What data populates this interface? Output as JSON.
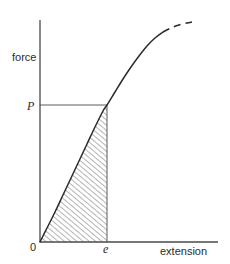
{
  "figure": {
    "background_color": "#ffffff",
    "ink_color": "#2b2b2b",
    "width": 230,
    "height": 264
  },
  "axes": {
    "y_axis_label": "force",
    "x_axis_label": "extension",
    "origin_label": "0",
    "y_axis": {
      "x": 40,
      "y_top": 20,
      "y_bottom": 242
    },
    "x_axis": {
      "y": 242,
      "x_left": 40,
      "x_right": 218
    }
  },
  "markers": {
    "force_value_label": "P",
    "extension_value_label": "e",
    "force_value_y": 105,
    "extension_value_x": 107
  },
  "guides": {
    "horizontal_from_p": {
      "x1": 40,
      "y1": 105,
      "x2": 107,
      "y2": 105
    },
    "vertical_at_e": {
      "x1": 107,
      "y1": 105,
      "x2": 107,
      "y2": 242
    }
  },
  "chart_data": {
    "type": "line",
    "title": "",
    "xlabel": "extension",
    "ylabel": "force",
    "grid": false,
    "legend": null,
    "annotations": [
      {
        "text": "P",
        "axis": "y",
        "meaning": "force at limit of proportionality"
      },
      {
        "text": "e",
        "axis": "x",
        "meaning": "extension at force P"
      },
      {
        "text": "0",
        "axis": "origin",
        "meaning": "origin"
      }
    ],
    "series": [
      {
        "name": "force-extension curve",
        "style": "solid-then-dashed",
        "dashed_from_x": 168,
        "points": [
          {
            "x": 40,
            "y": 242
          },
          {
            "x": 47,
            "y": 228
          },
          {
            "x": 55,
            "y": 212
          },
          {
            "x": 63,
            "y": 195
          },
          {
            "x": 71,
            "y": 178
          },
          {
            "x": 79,
            "y": 161
          },
          {
            "x": 87,
            "y": 144
          },
          {
            "x": 95,
            "y": 127
          },
          {
            "x": 103,
            "y": 111
          },
          {
            "x": 107,
            "y": 105
          },
          {
            "x": 115,
            "y": 92
          },
          {
            "x": 123,
            "y": 79
          },
          {
            "x": 131,
            "y": 67
          },
          {
            "x": 139,
            "y": 56
          },
          {
            "x": 147,
            "y": 46
          },
          {
            "x": 155,
            "y": 38
          },
          {
            "x": 163,
            "y": 32
          },
          {
            "x": 171,
            "y": 28
          },
          {
            "x": 179,
            "y": 25
          },
          {
            "x": 187,
            "y": 23
          },
          {
            "x": 192,
            "y": 22
          }
        ]
      }
    ],
    "shaded_region": {
      "name": "work-done-area",
      "fill": "diagonal-hatch",
      "hatch_angle_deg": 50,
      "hatch_spacing_px": 4,
      "bounded_by": [
        "curve",
        "vertical line at e",
        "x-axis"
      ]
    }
  }
}
